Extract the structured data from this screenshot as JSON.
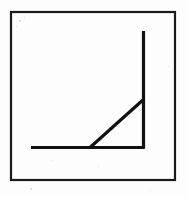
{
  "figure": {
    "canvas": {
      "width": 187,
      "height": 197,
      "background_color": "#fdfdfd"
    },
    "ink_color": "#111111",
    "frame": {
      "label": "outer-border",
      "x": 11,
      "y": 12,
      "width": 164,
      "height": 168,
      "stroke_width": 2.2,
      "color": "#1a1a1a"
    },
    "strokes": [
      {
        "name": "horizontal-baseline",
        "x1": 31,
        "y1": 147.5,
        "x2": 144.5,
        "y2": 147.5,
        "stroke_width": 3.2
      },
      {
        "name": "vertical-line",
        "x1": 143.5,
        "y1": 31,
        "x2": 143.5,
        "y2": 148.5,
        "stroke_width": 3.2
      },
      {
        "name": "diagonal-hypotenuse",
        "x1": 90,
        "y1": 147.5,
        "x2": 144,
        "y2": 99,
        "stroke_width": 3.2
      }
    ],
    "vertices": [
      {
        "name": "baseline-left-end",
        "x": 31,
        "y": 147.5
      },
      {
        "name": "diagonal-base-vertex",
        "x": 90,
        "y": 147.5
      },
      {
        "name": "right-angle-corner",
        "x": 143.5,
        "y": 147.5
      },
      {
        "name": "diagonal-top-vertex",
        "x": 143.5,
        "y": 99
      },
      {
        "name": "vertical-top-end",
        "x": 143.5,
        "y": 31
      }
    ],
    "specks": [
      {
        "x": 19,
        "y": 20,
        "size": 1.6
      },
      {
        "x": 24,
        "y": 17,
        "size": 1.3
      },
      {
        "x": 16,
        "y": 26,
        "size": 1.2
      },
      {
        "x": 168,
        "y": 66,
        "size": 1.4
      },
      {
        "x": 52,
        "y": 160,
        "size": 1.2
      },
      {
        "x": 98,
        "y": 166,
        "size": 1.3
      },
      {
        "x": 30,
        "y": 188,
        "size": 1.5
      },
      {
        "x": 150,
        "y": 190,
        "size": 1.2
      }
    ]
  }
}
